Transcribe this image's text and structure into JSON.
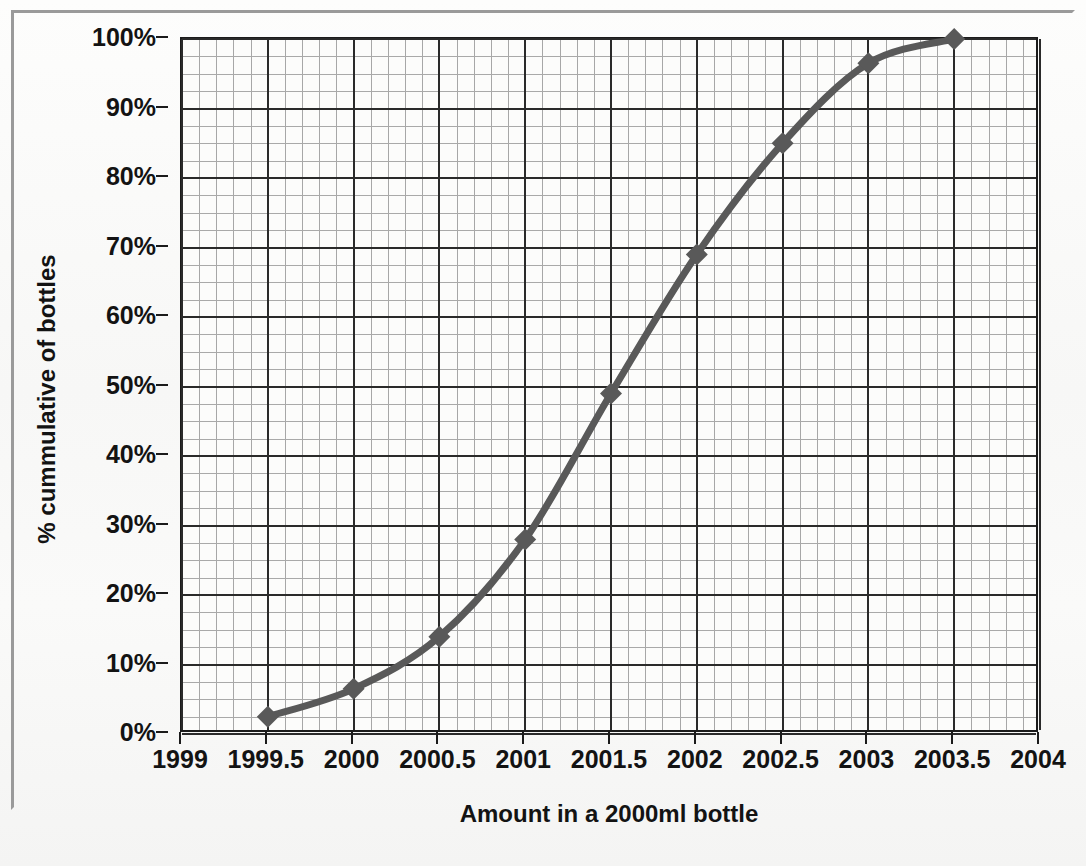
{
  "chart_data": {
    "type": "line",
    "title": "",
    "xlabel": "Amount in a 2000ml bottle",
    "ylabel": "% cummulative of bottles",
    "xlim": [
      1999,
      2004
    ],
    "ylim": [
      0,
      100
    ],
    "xtick_labels": [
      "1999",
      "1999.5",
      "2000",
      "2000.5",
      "2001",
      "2001.5",
      "2002",
      "2002.5",
      "2003",
      "2003.5",
      "2004"
    ],
    "xtick_values": [
      1999,
      1999.5,
      2000,
      2000.5,
      2001,
      2001.5,
      2002,
      2002.5,
      2003,
      2003.5,
      2004
    ],
    "ytick_labels": [
      "0%",
      "10%",
      "20%",
      "30%",
      "40%",
      "50%",
      "60%",
      "70%",
      "80%",
      "90%",
      "100%"
    ],
    "ytick_values": [
      0,
      10,
      20,
      30,
      40,
      50,
      60,
      70,
      80,
      90,
      100
    ],
    "grid": true,
    "minor_grid": true,
    "x_minor_step": 0.1,
    "y_minor_step": 2.5,
    "legend": false,
    "series": [
      {
        "name": "% cummulative of bottles",
        "color": "#595959",
        "marker": "diamond",
        "x": [
          1999.5,
          2000,
          2000.5,
          2001,
          2001.5,
          2002,
          2002.5,
          2003,
          2003.5
        ],
        "values": [
          2.5,
          6.5,
          14,
          28,
          49,
          69,
          85,
          96.5,
          100
        ]
      }
    ]
  },
  "colors": {
    "series_line": "#595959",
    "grid_major": "#2a2a2a",
    "grid_minor": "#a8a8a8",
    "axis": "#1b1b1b",
    "text": "#131313",
    "background": "#fbfbfa"
  }
}
